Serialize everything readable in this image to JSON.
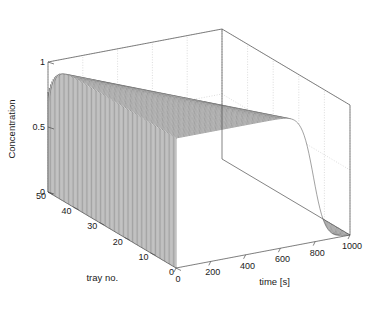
{
  "figure": {
    "kind": "3d-waterfall-plot",
    "background_color": "#ffffff",
    "line_color": "#555555",
    "face_color": "#ffffff",
    "grid_color": "#bfbfbf",
    "axis_color": "#4d4d4d",
    "text_color": "#1a1a1a"
  },
  "axes": {
    "z": {
      "title": "Concentration",
      "ticks": [
        "1",
        "0.5",
        "0"
      ],
      "tick_values": [
        1,
        0.5,
        0
      ],
      "range": [
        0,
        1
      ]
    },
    "y": {
      "title": "tray no.",
      "ticks": [
        "50",
        "40",
        "30",
        "20",
        "10",
        "0"
      ],
      "tick_values": [
        50,
        40,
        30,
        20,
        10,
        0
      ],
      "range": [
        0,
        50
      ]
    },
    "x": {
      "title": "time [s]",
      "ticks": [
        "0",
        "200",
        "400",
        "600",
        "800",
        "1000"
      ],
      "tick_values": [
        0,
        200,
        400,
        600,
        800,
        1000
      ],
      "range": [
        0,
        1000
      ]
    }
  },
  "chart_data": {
    "type": "line",
    "title": "",
    "xlabel": "time [s]",
    "ylabel": "tray no.",
    "zlabel": "Concentration",
    "xlim": [
      0,
      1000
    ],
    "ylim": [
      0,
      50
    ],
    "zlim": [
      0,
      1
    ],
    "grid": true,
    "legend": null,
    "series_count": 26,
    "x": [
      0,
      40,
      80,
      120,
      160,
      200,
      240,
      280,
      320,
      360,
      400,
      440,
      480,
      520,
      560,
      600,
      640,
      680,
      720,
      760,
      800,
      840,
      880,
      920,
      960,
      1000
    ],
    "series": [
      {
        "name": "tray 50",
        "tray": 50,
        "breakthrough_time": 40,
        "values": [
          1.0,
          0.5,
          0.1,
          0.02,
          0.0,
          0.0,
          0.0,
          0.0,
          0.0,
          0.0,
          0.0,
          0.0,
          0.0,
          0.0,
          0.0,
          0.0,
          0.0,
          0.0,
          0.0,
          0.0,
          0.0,
          0.0,
          0.0,
          0.0,
          0.0,
          0.0
        ]
      },
      {
        "name": "tray 48",
        "tray": 48,
        "breakthrough_time": 70,
        "values": [
          1.0,
          0.82,
          0.4,
          0.1,
          0.02,
          0.0,
          0.0,
          0.0,
          0.0,
          0.0,
          0.0,
          0.0,
          0.0,
          0.0,
          0.0,
          0.0,
          0.0,
          0.0,
          0.0,
          0.0,
          0.0,
          0.0,
          0.0,
          0.0,
          0.0,
          0.0
        ]
      },
      {
        "name": "tray 46",
        "tray": 46,
        "breakthrough_time": 100,
        "values": [
          1.0,
          0.94,
          0.7,
          0.3,
          0.07,
          0.01,
          0.0,
          0.0,
          0.0,
          0.0,
          0.0,
          0.0,
          0.0,
          0.0,
          0.0,
          0.0,
          0.0,
          0.0,
          0.0,
          0.0,
          0.0,
          0.0,
          0.0,
          0.0,
          0.0,
          0.0
        ]
      },
      {
        "name": "tray 44",
        "tray": 44,
        "breakthrough_time": 130,
        "values": [
          1.0,
          0.98,
          0.88,
          0.58,
          0.22,
          0.05,
          0.01,
          0.0,
          0.0,
          0.0,
          0.0,
          0.0,
          0.0,
          0.0,
          0.0,
          0.0,
          0.0,
          0.0,
          0.0,
          0.0,
          0.0,
          0.0,
          0.0,
          0.0,
          0.0,
          0.0
        ]
      },
      {
        "name": "tray 42",
        "tray": 42,
        "breakthrough_time": 160,
        "values": [
          1.0,
          0.99,
          0.95,
          0.8,
          0.46,
          0.15,
          0.03,
          0.0,
          0.0,
          0.0,
          0.0,
          0.0,
          0.0,
          0.0,
          0.0,
          0.0,
          0.0,
          0.0,
          0.0,
          0.0,
          0.0,
          0.0,
          0.0,
          0.0,
          0.0,
          0.0
        ]
      },
      {
        "name": "tray 40",
        "tray": 40,
        "breakthrough_time": 190,
        "values": [
          1.0,
          1.0,
          0.98,
          0.92,
          0.72,
          0.37,
          0.1,
          0.02,
          0.0,
          0.0,
          0.0,
          0.0,
          0.0,
          0.0,
          0.0,
          0.0,
          0.0,
          0.0,
          0.0,
          0.0,
          0.0,
          0.0,
          0.0,
          0.0,
          0.0,
          0.0
        ]
      },
      {
        "name": "tray 38",
        "tray": 38,
        "breakthrough_time": 220,
        "values": [
          1.0,
          1.0,
          0.99,
          0.97,
          0.88,
          0.64,
          0.28,
          0.07,
          0.01,
          0.0,
          0.0,
          0.0,
          0.0,
          0.0,
          0.0,
          0.0,
          0.0,
          0.0,
          0.0,
          0.0,
          0.0,
          0.0,
          0.0,
          0.0,
          0.0,
          0.0
        ]
      },
      {
        "name": "tray 36",
        "tray": 36,
        "breakthrough_time": 250,
        "values": [
          1.0,
          1.0,
          1.0,
          0.99,
          0.95,
          0.84,
          0.56,
          0.22,
          0.05,
          0.01,
          0.0,
          0.0,
          0.0,
          0.0,
          0.0,
          0.0,
          0.0,
          0.0,
          0.0,
          0.0,
          0.0,
          0.0,
          0.0,
          0.0,
          0.0,
          0.0
        ]
      },
      {
        "name": "tray 34",
        "tray": 34,
        "breakthrough_time": 280,
        "values": [
          1.0,
          1.0,
          1.0,
          1.0,
          0.98,
          0.94,
          0.79,
          0.48,
          0.17,
          0.04,
          0.0,
          0.0,
          0.0,
          0.0,
          0.0,
          0.0,
          0.0,
          0.0,
          0.0,
          0.0,
          0.0,
          0.0,
          0.0,
          0.0,
          0.0,
          0.0
        ]
      },
      {
        "name": "tray 32",
        "tray": 32,
        "breakthrough_time": 310,
        "values": [
          1.0,
          1.0,
          1.0,
          1.0,
          0.99,
          0.97,
          0.91,
          0.73,
          0.41,
          0.13,
          0.02,
          0.0,
          0.0,
          0.0,
          0.0,
          0.0,
          0.0,
          0.0,
          0.0,
          0.0,
          0.0,
          0.0,
          0.0,
          0.0,
          0.0,
          0.0
        ]
      },
      {
        "name": "tray 30",
        "tray": 30,
        "breakthrough_time": 340,
        "values": [
          1.0,
          1.0,
          1.0,
          1.0,
          1.0,
          0.99,
          0.96,
          0.88,
          0.67,
          0.35,
          0.1,
          0.01,
          0.0,
          0.0,
          0.0,
          0.0,
          0.0,
          0.0,
          0.0,
          0.0,
          0.0,
          0.0,
          0.0,
          0.0,
          0.0,
          0.0
        ]
      },
      {
        "name": "tray 28",
        "tray": 28,
        "breakthrough_time": 370,
        "values": [
          1.0,
          1.0,
          1.0,
          1.0,
          1.0,
          1.0,
          0.99,
          0.95,
          0.84,
          0.6,
          0.29,
          0.07,
          0.01,
          0.0,
          0.0,
          0.0,
          0.0,
          0.0,
          0.0,
          0.0,
          0.0,
          0.0,
          0.0,
          0.0,
          0.0,
          0.0
        ]
      },
      {
        "name": "tray 26",
        "tray": 26,
        "breakthrough_time": 400,
        "values": [
          1.0,
          1.0,
          1.0,
          1.0,
          1.0,
          1.0,
          0.99,
          0.98,
          0.93,
          0.8,
          0.54,
          0.24,
          0.06,
          0.01,
          0.0,
          0.0,
          0.0,
          0.0,
          0.0,
          0.0,
          0.0,
          0.0,
          0.0,
          0.0,
          0.0,
          0.0
        ]
      },
      {
        "name": "tray 24",
        "tray": 24,
        "breakthrough_time": 430,
        "values": [
          1.0,
          1.0,
          1.0,
          1.0,
          1.0,
          1.0,
          1.0,
          0.99,
          0.97,
          0.91,
          0.76,
          0.47,
          0.18,
          0.04,
          0.0,
          0.0,
          0.0,
          0.0,
          0.0,
          0.0,
          0.0,
          0.0,
          0.0,
          0.0,
          0.0,
          0.0
        ]
      },
      {
        "name": "tray 22",
        "tray": 22,
        "breakthrough_time": 460,
        "values": [
          1.0,
          1.0,
          1.0,
          1.0,
          1.0,
          1.0,
          1.0,
          1.0,
          0.99,
          0.97,
          0.89,
          0.7,
          0.39,
          0.13,
          0.02,
          0.0,
          0.0,
          0.0,
          0.0,
          0.0,
          0.0,
          0.0,
          0.0,
          0.0,
          0.0,
          0.0
        ]
      },
      {
        "name": "tray 20",
        "tray": 20,
        "breakthrough_time": 490,
        "values": [
          1.0,
          1.0,
          1.0,
          1.0,
          1.0,
          1.0,
          1.0,
          1.0,
          1.0,
          0.99,
          0.96,
          0.86,
          0.63,
          0.32,
          0.09,
          0.01,
          0.0,
          0.0,
          0.0,
          0.0,
          0.0,
          0.0,
          0.0,
          0.0,
          0.0,
          0.0
        ]
      },
      {
        "name": "tray 18",
        "tray": 18,
        "breakthrough_time": 520,
        "values": [
          1.0,
          1.0,
          1.0,
          1.0,
          1.0,
          1.0,
          1.0,
          1.0,
          1.0,
          1.0,
          0.99,
          0.95,
          0.82,
          0.56,
          0.26,
          0.06,
          0.01,
          0.0,
          0.0,
          0.0,
          0.0,
          0.0,
          0.0,
          0.0,
          0.0,
          0.0
        ]
      },
      {
        "name": "tray 16",
        "tray": 16,
        "breakthrough_time": 550,
        "values": [
          1.0,
          1.0,
          1.0,
          1.0,
          1.0,
          1.0,
          1.0,
          1.0,
          1.0,
          1.0,
          1.0,
          0.98,
          0.93,
          0.77,
          0.49,
          0.2,
          0.04,
          0.0,
          0.0,
          0.0,
          0.0,
          0.0,
          0.0,
          0.0,
          0.0,
          0.0
        ]
      },
      {
        "name": "tray 14",
        "tray": 14,
        "breakthrough_time": 580,
        "values": [
          1.0,
          1.0,
          1.0,
          1.0,
          1.0,
          1.0,
          1.0,
          1.0,
          1.0,
          1.0,
          1.0,
          0.99,
          0.97,
          0.9,
          0.72,
          0.42,
          0.15,
          0.03,
          0.0,
          0.0,
          0.0,
          0.0,
          0.0,
          0.0,
          0.0,
          0.0
        ]
      },
      {
        "name": "tray 12",
        "tray": 12,
        "breakthrough_time": 610,
        "values": [
          1.0,
          1.0,
          1.0,
          1.0,
          1.0,
          1.0,
          1.0,
          1.0,
          1.0,
          1.0,
          1.0,
          1.0,
          0.99,
          0.96,
          0.87,
          0.65,
          0.35,
          0.11,
          0.02,
          0.0,
          0.0,
          0.0,
          0.0,
          0.0,
          0.0,
          0.0
        ]
      },
      {
        "name": "tray 10",
        "tray": 10,
        "breakthrough_time": 640,
        "values": [
          1.0,
          1.0,
          1.0,
          1.0,
          1.0,
          1.0,
          1.0,
          1.0,
          1.0,
          1.0,
          1.0,
          1.0,
          1.0,
          0.99,
          0.95,
          0.83,
          0.58,
          0.28,
          0.08,
          0.01,
          0.0,
          0.0,
          0.0,
          0.0,
          0.0,
          0.0
        ]
      },
      {
        "name": "tray 8",
        "tray": 8,
        "breakthrough_time": 670,
        "values": [
          1.0,
          1.0,
          1.0,
          1.0,
          1.0,
          1.0,
          1.0,
          1.0,
          1.0,
          1.0,
          1.0,
          1.0,
          1.0,
          1.0,
          0.99,
          0.94,
          0.79,
          0.51,
          0.22,
          0.05,
          0.01,
          0.0,
          0.0,
          0.0,
          0.0,
          0.0
        ]
      },
      {
        "name": "tray 6",
        "tray": 6,
        "breakthrough_time": 700,
        "values": [
          1.0,
          1.0,
          1.0,
          1.0,
          1.0,
          1.0,
          1.0,
          1.0,
          1.0,
          1.0,
          1.0,
          1.0,
          1.0,
          1.0,
          1.0,
          0.98,
          0.92,
          0.74,
          0.44,
          0.17,
          0.03,
          0.0,
          0.0,
          0.0,
          0.0,
          0.0
        ]
      },
      {
        "name": "tray 4",
        "tray": 4,
        "breakthrough_time": 730,
        "values": [
          1.0,
          1.0,
          1.0,
          1.0,
          1.0,
          1.0,
          1.0,
          1.0,
          1.0,
          1.0,
          1.0,
          1.0,
          1.0,
          1.0,
          1.0,
          1.0,
          0.97,
          0.89,
          0.68,
          0.37,
          0.12,
          0.02,
          0.0,
          0.0,
          0.0,
          0.0
        ]
      },
      {
        "name": "tray 2",
        "tray": 2,
        "breakthrough_time": 760,
        "values": [
          1.0,
          1.0,
          1.0,
          1.0,
          1.0,
          1.0,
          1.0,
          1.0,
          1.0,
          1.0,
          1.0,
          1.0,
          1.0,
          1.0,
          1.0,
          1.0,
          0.99,
          0.96,
          0.85,
          0.61,
          0.3,
          0.09,
          0.01,
          0.0,
          0.0,
          0.0
        ]
      },
      {
        "name": "tray 0",
        "tray": 0,
        "breakthrough_time": 790,
        "values": [
          1.0,
          1.0,
          1.0,
          1.0,
          1.0,
          1.0,
          1.0,
          1.0,
          1.0,
          1.0,
          1.0,
          1.0,
          1.0,
          1.0,
          1.0,
          1.0,
          1.0,
          0.99,
          0.94,
          0.81,
          0.55,
          0.25,
          0.06,
          0.01,
          0.0,
          0.0
        ]
      }
    ]
  }
}
